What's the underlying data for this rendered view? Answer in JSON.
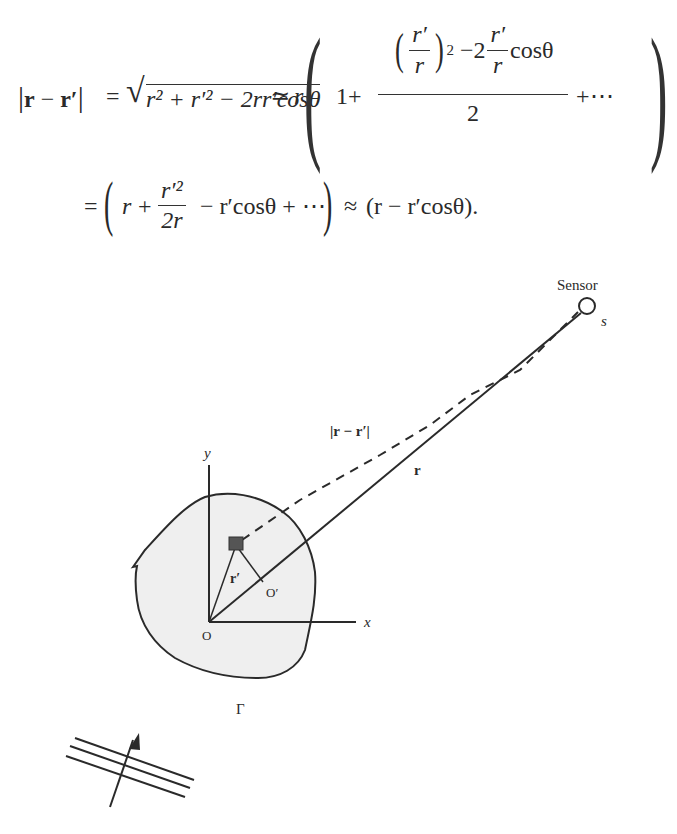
{
  "equations": {
    "line1": {
      "lhs": "|r − r′|",
      "eq_sign": "=",
      "sqrt_content": "r² + r′² − 2rr′cosθ",
      "approx_sign": "≃",
      "r_factor": "r",
      "one_plus": "1+",
      "inner_num_frac_num": "r′",
      "inner_num_frac_den": "r",
      "inner_exponent": "2",
      "minus_two": "−2",
      "second_frac_num": "r′",
      "second_frac_den": "r",
      "cos_theta": "cosθ",
      "denominator": "2",
      "tail": "+⋯"
    },
    "line2": {
      "eq_sign": "=",
      "r": "r",
      "plus": "+",
      "frac_num": "r′²",
      "frac_den": "2r",
      "middle": "− r′cosθ + ⋯",
      "approx": "≈",
      "result": "(r − r′cosθ)."
    }
  },
  "diagram": {
    "labels": {
      "sensor": "Sensor",
      "s": "s",
      "r_minus_rprime": "|r − r′|",
      "r": "r",
      "y": "y",
      "x": "x",
      "origin": "O",
      "o_prime": "O′",
      "r_prime": "r′",
      "boundary": "Γ"
    },
    "points": {
      "origin": [
        209,
        622
      ],
      "source_element": [
        236,
        544
      ],
      "o_prime": [
        262,
        582
      ],
      "sensor": [
        587,
        306
      ]
    },
    "colors": {
      "region_fill": "#efefef",
      "stroke": "#2a2a2a",
      "source_fill": "#555555"
    }
  }
}
